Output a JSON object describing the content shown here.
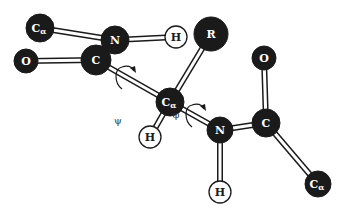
{
  "diagram": {
    "colors": {
      "dark_atom": "#1a1a1a",
      "light_atom": "#ffffff",
      "outline": "#1a1a1a",
      "dark_label": "#ffffff",
      "light_label": "#1a1a1a"
    },
    "atoms": [
      {
        "id": "ca1",
        "label": "Cα",
        "sym": "C",
        "sub": "α",
        "x": 40,
        "y": 28,
        "r": 14,
        "type": "dark"
      },
      {
        "id": "n1",
        "label": "N",
        "sym": "N",
        "sub": "",
        "x": 115,
        "y": 40,
        "r": 14,
        "type": "dark"
      },
      {
        "id": "h1",
        "label": "H",
        "sym": "H",
        "sub": "",
        "x": 176,
        "y": 37,
        "r": 11,
        "type": "light"
      },
      {
        "id": "r",
        "label": "R",
        "sym": "R",
        "sub": "",
        "x": 211,
        "y": 34,
        "r": 17,
        "type": "dark"
      },
      {
        "id": "o1",
        "label": "O",
        "sym": "O",
        "sub": "",
        "x": 26,
        "y": 61,
        "r": 12,
        "type": "dark"
      },
      {
        "id": "c1",
        "label": "C",
        "sym": "C",
        "sub": "",
        "x": 96,
        "y": 60,
        "r": 15,
        "type": "dark"
      },
      {
        "id": "ca2",
        "label": "Cα",
        "sym": "C",
        "sub": "α",
        "x": 170,
        "y": 102,
        "r": 14,
        "type": "dark"
      },
      {
        "id": "h2",
        "label": "H",
        "sym": "H",
        "sub": "",
        "x": 150,
        "y": 137,
        "r": 11,
        "type": "light"
      },
      {
        "id": "o2",
        "label": "O",
        "sym": "O",
        "sub": "",
        "x": 264,
        "y": 58,
        "r": 12,
        "type": "dark"
      },
      {
        "id": "n2",
        "label": "N",
        "sym": "N",
        "sub": "",
        "x": 220,
        "y": 130,
        "r": 13,
        "type": "dark"
      },
      {
        "id": "c2",
        "label": "C",
        "sym": "C",
        "sub": "",
        "x": 266,
        "y": 123,
        "r": 14,
        "type": "dark"
      },
      {
        "id": "h3",
        "label": "H",
        "sym": "H",
        "sub": "",
        "x": 220,
        "y": 192,
        "r": 11,
        "type": "light"
      },
      {
        "id": "ca3",
        "label": "Cα",
        "sym": "C",
        "sub": "α",
        "x": 318,
        "y": 184,
        "r": 13,
        "type": "dark"
      }
    ],
    "bonds": [
      {
        "from": "ca1",
        "to": "n1"
      },
      {
        "from": "n1",
        "to": "h1"
      },
      {
        "from": "n1",
        "to": "c1"
      },
      {
        "from": "o1",
        "to": "c1"
      },
      {
        "from": "c1",
        "to": "ca2"
      },
      {
        "from": "ca2",
        "to": "r"
      },
      {
        "from": "ca2",
        "to": "h2"
      },
      {
        "from": "ca2",
        "to": "n2"
      },
      {
        "from": "n2",
        "to": "c2"
      },
      {
        "from": "n2",
        "to": "h3"
      },
      {
        "from": "c2",
        "to": "o2"
      },
      {
        "from": "c2",
        "to": "ca3"
      }
    ],
    "angles": [
      {
        "id": "psi",
        "label": "ψ",
        "x": 118,
        "y": 124,
        "arrow": {
          "cx": 124,
          "cy": 77,
          "bond": [
            "c1",
            "ca2"
          ]
        }
      },
      {
        "id": "phi",
        "label": "φ",
        "x": 176,
        "y": 118,
        "arrow": {
          "cx": 194,
          "cy": 115,
          "bond": [
            "ca2",
            "n2"
          ]
        }
      }
    ]
  }
}
